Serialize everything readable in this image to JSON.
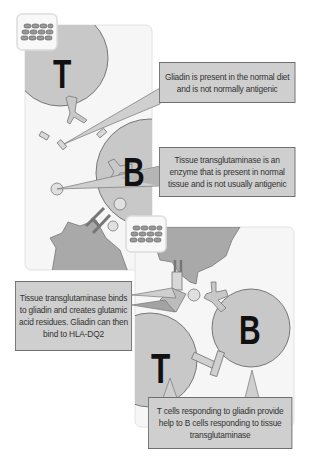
{
  "diagram": {
    "top_panel": {
      "cell_labels": {
        "t_cell": "T",
        "b_cell": "B"
      },
      "icon": "epithelium-tile-icon"
    },
    "bottom_panel": {
      "cell_labels": {
        "t_cell": "T",
        "b_cell": "B"
      },
      "icon": "epithelium-tile-icon"
    },
    "callouts": {
      "gliadin": "Gliadin is present in the normal diet and is not normally antigenic",
      "transglutaminase": "Tissue transglutaminase is an enzyme that is present in normal tissue and is not usually antigenic",
      "binding": "Tissue transglutaminase binds to gliadin and creates glutamic acid residues. Gliadin can then bind to HLA-DQ2",
      "help": "T cells responding to gliadin provide help to B cells responding to tissue transglutaminase"
    },
    "colors": {
      "cell_fill": "#c8c8c8",
      "cell_stroke": "#777777",
      "damaged_tissue": "#a9a9a9",
      "callout_bg": "#cfcfcf",
      "panel_bg": "#f6f6f6",
      "label_text": "#111111"
    }
  }
}
